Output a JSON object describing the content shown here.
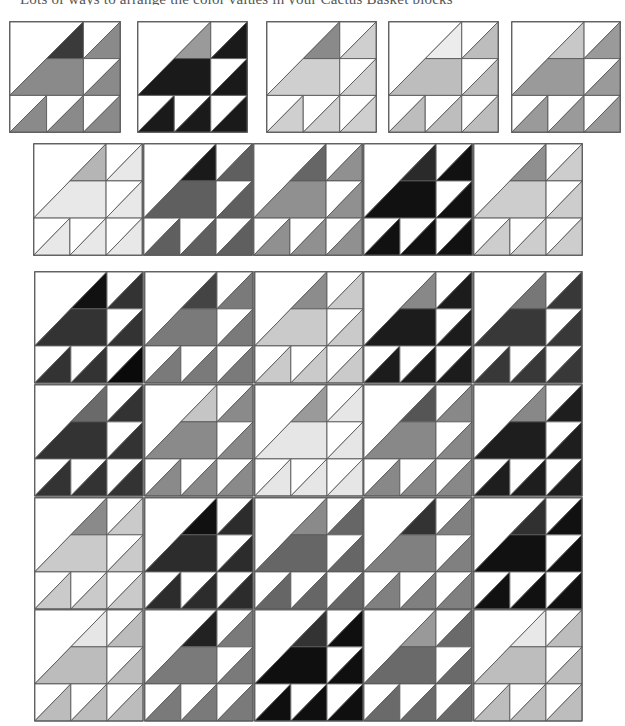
{
  "caption": "Lots of ways to arrange the color values in your Cactus Basket blocks",
  "stroke_color": "#5a5a5a",
  "background_color": "#ffffff",
  "pattern": {
    "name": "cactus-basket-block",
    "grid": "3x3",
    "pieces": [
      "large-hst-white-upper-left",
      "accent-triangle",
      "main-trapezoid",
      "small-hst-x5"
    ]
  },
  "sample_rows": [
    {
      "name": "sample-row-1",
      "blocks": [
        {
          "x": 9,
          "y": 21,
          "w": 112,
          "h": 112,
          "accent": "#3a3a3a",
          "main": "#8a8a8a",
          "hst": [
            "#8a8a8a",
            "#8a8a8a",
            "#8a8a8a",
            "#8a8a8a",
            "#8a8a8a"
          ]
        },
        {
          "x": 137,
          "y": 21,
          "w": 111,
          "h": 112,
          "accent": "#9a9a9a",
          "main": "#1a1a1a",
          "hst": [
            "#1a1a1a",
            "#1a1a1a",
            "#1a1a1a",
            "#1a1a1a",
            "#1a1a1a"
          ]
        },
        {
          "x": 266,
          "y": 21,
          "w": 111,
          "h": 112,
          "accent": "#8a8a8a",
          "main": "#cfcfcf",
          "hst": [
            "#cfcfcf",
            "#cfcfcf",
            "#cfcfcf",
            "#cfcfcf",
            "#cfcfcf"
          ]
        },
        {
          "x": 388,
          "y": 21,
          "w": 111,
          "h": 112,
          "accent": "#ececec",
          "main": "#bdbdbd",
          "hst": [
            "#bdbdbd",
            "#bdbdbd",
            "#bdbdbd",
            "#bdbdbd",
            "#bdbdbd"
          ]
        },
        {
          "x": 511,
          "y": 21,
          "w": 110,
          "h": 112,
          "accent": "#c8c8c8",
          "main": "#9a9a9a",
          "hst": [
            "#9a9a9a",
            "#9a9a9a",
            "#9a9a9a",
            "#9a9a9a",
            "#9a9a9a"
          ]
        }
      ]
    },
    {
      "name": "sample-row-2",
      "blocks": [
        {
          "x": 33,
          "y": 143,
          "w": 110,
          "h": 113,
          "accent": "#b5b5b5",
          "main": "#e8e8e8",
          "hst": [
            "#e8e8e8",
            "#e8e8e8",
            "#e8e8e8",
            "#e8e8e8",
            "#e8e8e8"
          ]
        },
        {
          "x": 143,
          "y": 143,
          "w": 110,
          "h": 113,
          "accent": "#1a1a1a",
          "main": "#5f5f5f",
          "hst": [
            "#5f5f5f",
            "#5f5f5f",
            "#5f5f5f",
            "#5f5f5f",
            "#5f5f5f"
          ]
        },
        {
          "x": 253,
          "y": 143,
          "w": 110,
          "h": 113,
          "accent": "#666666",
          "main": "#909090",
          "hst": [
            "#909090",
            "#909090",
            "#909090",
            "#909090",
            "#909090"
          ]
        },
        {
          "x": 363,
          "y": 143,
          "w": 110,
          "h": 113,
          "accent": "#2a2a2a",
          "main": "#111111",
          "hst": [
            "#111111",
            "#111111",
            "#111111",
            "#111111",
            "#111111"
          ]
        },
        {
          "x": 473,
          "y": 143,
          "w": 110,
          "h": 113,
          "accent": "#8f8f8f",
          "main": "#cdcdcd",
          "hst": [
            "#cdcdcd",
            "#cdcdcd",
            "#cdcdcd",
            "#cdcdcd",
            "#cdcdcd"
          ]
        }
      ]
    }
  ],
  "quilt": {
    "name": "quilt-layout-5x4",
    "x": 34,
    "y": 271,
    "w": 549,
    "h": 451,
    "cols": 5,
    "rows": 4,
    "blocks": [
      [
        {
          "accent": "#111111",
          "main": "#333333",
          "hst": [
            "#333333",
            "#333333",
            "#333333",
            "#333333",
            "#0a0a0a"
          ]
        },
        {
          "accent": "#444444",
          "main": "#7a7a7a",
          "hst": [
            "#7a7a7a",
            "#7a7a7a",
            "#7a7a7a",
            "#7a7a7a",
            "#7a7a7a"
          ]
        },
        {
          "accent": "#8c8c8c",
          "main": "#cacaca",
          "hst": [
            "#cacaca",
            "#cacaca",
            "#cacaca",
            "#cacaca",
            "#cacaca"
          ]
        },
        {
          "accent": "#888888",
          "main": "#1c1c1c",
          "hst": [
            "#1c1c1c",
            "#1c1c1c",
            "#1c1c1c",
            "#1c1c1c",
            "#1c1c1c"
          ]
        },
        {
          "accent": "#777777",
          "main": "#383838",
          "hst": [
            "#383838",
            "#383838",
            "#383838",
            "#383838",
            "#383838"
          ]
        }
      ],
      [
        {
          "accent": "#6a6a6a",
          "main": "#333333",
          "hst": [
            "#333333",
            "#333333",
            "#333333",
            "#333333",
            "#333333"
          ]
        },
        {
          "accent": "#c5c5c5",
          "main": "#8a8a8a",
          "hst": [
            "#8a8a8a",
            "#8a8a8a",
            "#8a8a8a",
            "#8a8a8a",
            "#8a8a8a"
          ]
        },
        {
          "accent": "#9a9a9a",
          "main": "#e6e6e6",
          "hst": [
            "#e6e6e6",
            "#e6e6e6",
            "#e6e6e6",
            "#e6e6e6",
            "#e6e6e6"
          ]
        },
        {
          "accent": "#555555",
          "main": "#888888",
          "hst": [
            "#888888",
            "#888888",
            "#888888",
            "#888888",
            "#888888"
          ]
        },
        {
          "accent": "#888888",
          "main": "#1e1e1e",
          "hst": [
            "#1e1e1e",
            "#1e1e1e",
            "#1e1e1e",
            "#1e1e1e",
            "#1e1e1e"
          ]
        }
      ],
      [
        {
          "accent": "#8a8a8a",
          "main": "#cacaca",
          "hst": [
            "#cacaca",
            "#cacaca",
            "#cacaca",
            "#cacaca",
            "#cacaca"
          ]
        },
        {
          "accent": "#111111",
          "main": "#2c2c2c",
          "hst": [
            "#2c2c2c",
            "#2c2c2c",
            "#2c2c2c",
            "#2c2c2c",
            "#2c2c2c"
          ]
        },
        {
          "accent": "#8a8a8a",
          "main": "#666666",
          "hst": [
            "#666666",
            "#666666",
            "#666666",
            "#666666",
            "#666666"
          ]
        },
        {
          "accent": "#333333",
          "main": "#808080",
          "hst": [
            "#808080",
            "#808080",
            "#808080",
            "#808080",
            "#808080"
          ]
        },
        {
          "accent": "#303030",
          "main": "#111111",
          "hst": [
            "#111111",
            "#111111",
            "#111111",
            "#111111",
            "#111111"
          ]
        }
      ],
      [
        {
          "accent": "#e6e6e6",
          "main": "#bcbcbc",
          "hst": [
            "#bcbcbc",
            "#bcbcbc",
            "#bcbcbc",
            "#bcbcbc",
            "#bcbcbc"
          ]
        },
        {
          "accent": "#222222",
          "main": "#7a7a7a",
          "hst": [
            "#7a7a7a",
            "#7a7a7a",
            "#7a7a7a",
            "#7a7a7a",
            "#7a7a7a"
          ]
        },
        {
          "accent": "#333333",
          "main": "#0f0f0f",
          "hst": [
            "#0f0f0f",
            "#0f0f0f",
            "#0f0f0f",
            "#0f0f0f",
            "#0f0f0f"
          ]
        },
        {
          "accent": "#999999",
          "main": "#6a6a6a",
          "hst": [
            "#6a6a6a",
            "#6a6a6a",
            "#6a6a6a",
            "#6a6a6a",
            "#6a6a6a"
          ]
        },
        {
          "accent": "#e8e8e8",
          "main": "#bdbdbd",
          "hst": [
            "#bdbdbd",
            "#bdbdbd",
            "#bdbdbd",
            "#bdbdbd",
            "#bdbdbd"
          ]
        }
      ]
    ]
  }
}
